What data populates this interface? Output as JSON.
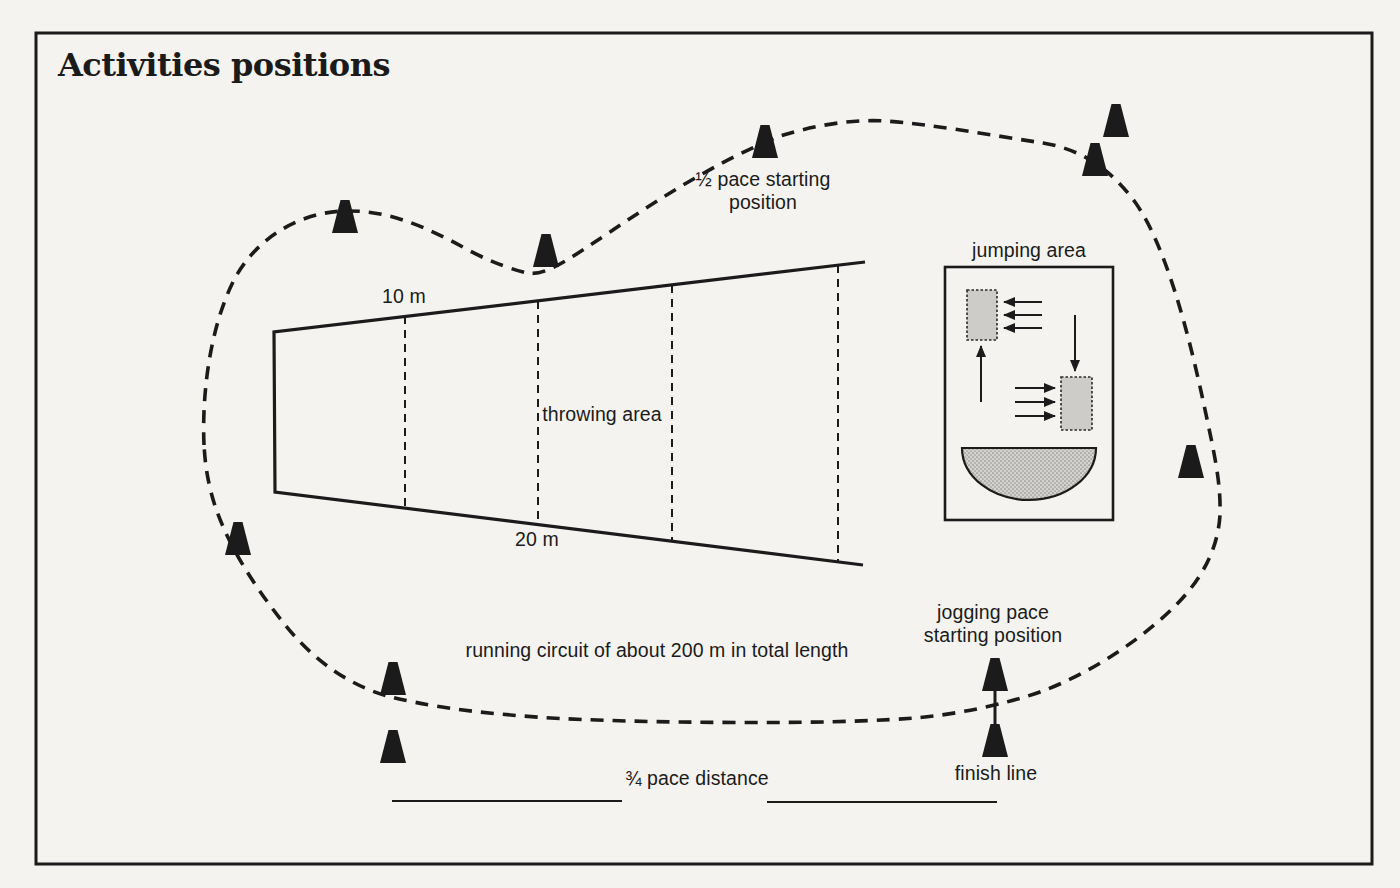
{
  "title": "Activities positions",
  "colors": {
    "ink": "#1b1b1b",
    "paper": "#f4f3ef",
    "fill": "#cbcac6"
  },
  "labels": {
    "half_pace": "½ pace starting\nposition",
    "jumping_area": "jumping area",
    "throwing_top_width": "10 m",
    "throwing_area": "throwing area",
    "throwing_bottom_width": "20 m",
    "running_circuit": "running circuit of about 200 m in total length",
    "jogging_pace": "jogging pace\nstarting position",
    "three_quarter_pace": "¾ pace distance",
    "finish_line": "finish line"
  },
  "figure": {
    "circuit_marker_count": 11,
    "throwing_area_divider_count": 4,
    "jumping_area_mat_count": 2
  },
  "cones": [
    {
      "x": 345,
      "base": 233
    },
    {
      "x": 546,
      "base": 267
    },
    {
      "x": 765,
      "base": 158
    },
    {
      "x": 1095,
      "base": 176
    },
    {
      "x": 1116,
      "base": 137
    },
    {
      "x": 1191,
      "base": 478
    },
    {
      "x": 238,
      "base": 555
    },
    {
      "x": 393,
      "base": 695
    },
    {
      "x": 393,
      "base": 763
    },
    {
      "x": 995,
      "base": 691
    },
    {
      "x": 995,
      "base": 757
    }
  ]
}
